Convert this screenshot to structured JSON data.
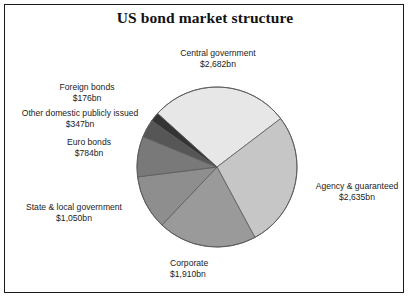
{
  "chart_title": "US bond market structure",
  "chart_data": {
    "type": "pie",
    "title": "US bond market structure",
    "xlabel": "",
    "ylabel": "",
    "unit": "bn",
    "currency": "$",
    "total": 9584,
    "legend_position": "none",
    "grid": false,
    "labels_outside": true,
    "start_angle_deg": -48,
    "direction": "clockwise",
    "categories": [
      "Central government",
      "Agency & guaranteed",
      "Corporate",
      "State & local government",
      "Euro bonds",
      "Other domestic publicly issued",
      "Foreign  bonds"
    ],
    "values": [
      2682,
      2635,
      1910,
      1050,
      784,
      347,
      176
    ],
    "value_labels": [
      "$2,682bn",
      "$2,635bn",
      "$1,910bn",
      "$1,050bn",
      "$784bn",
      "$347bn",
      "$176bn"
    ],
    "colors": [
      "#e7e7e7",
      "#c6c6c6",
      "#9a9a9a",
      "#8e8e8e",
      "#797979",
      "#565656",
      "#343434"
    ],
    "slices": [
      {
        "name": "Central government",
        "value": 2682,
        "value_label": "$2,682bn",
        "color": "#e7e7e7",
        "percent": 28.0
      },
      {
        "name": "Agency & guaranteed",
        "value": 2635,
        "value_label": "$2,635bn",
        "color": "#c6c6c6",
        "percent": 27.5
      },
      {
        "name": "Corporate",
        "value": 1910,
        "value_label": "$1,910bn",
        "color": "#9a9a9a",
        "percent": 19.9
      },
      {
        "name": "State & local government",
        "value": 1050,
        "value_label": "$1,050bn",
        "color": "#8e8e8e",
        "percent": 11.0
      },
      {
        "name": "Euro bonds",
        "value": 784,
        "value_label": "$784bn",
        "color": "#797979",
        "percent": 8.2
      },
      {
        "name": "Other domestic publicly issued",
        "value": 347,
        "value_label": "$347bn",
        "color": "#565656",
        "percent": 3.6
      },
      {
        "name": "Foreign  bonds",
        "value": 176,
        "value_label": "$176bn",
        "color": "#343434",
        "percent": 1.8
      }
    ]
  },
  "labels": {
    "central": {
      "name": "Central government",
      "value": "$2,682bn"
    },
    "agency": {
      "name": "Agency & guaranteed",
      "value": "$2,635bn"
    },
    "corporate": {
      "name": "Corporate",
      "value": "$1,910bn"
    },
    "state": {
      "name": "State & local government",
      "value": "$1,050bn"
    },
    "euro": {
      "name": "Euro bonds",
      "value": "$784bn"
    },
    "otherdom": {
      "name": "Other domestic publicly issued",
      "value": "$347bn"
    },
    "foreign": {
      "name": "Foreign  bonds",
      "value": "$176bn"
    }
  },
  "style": {
    "frame_border_color": "#1a1a1a",
    "background": "#ffffff",
    "text_color": "#1c1c1c",
    "slice_outline": "#5a5a5a"
  }
}
